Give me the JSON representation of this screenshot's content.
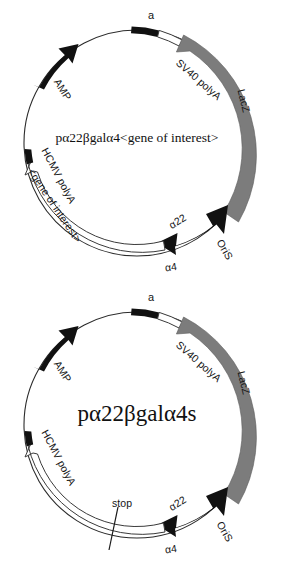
{
  "figure": {
    "kind": "plasmid-map-pair",
    "background_color": "#ffffff",
    "colors": {
      "backbone": "#2b2b2b",
      "black_feature": "#111111",
      "gray_feature": "#7c7c7c",
      "white_feature": "#ffffff",
      "text": "#151515"
    }
  },
  "plasmids": [
    {
      "id": "top",
      "center_label": "pα22βgalα4<gene of interest>",
      "features": [
        {
          "name": "a",
          "label": "a",
          "style": "black-bar",
          "arrow": "none",
          "position": "top"
        },
        {
          "name": "sv40-polya",
          "label": "SV40 polyA",
          "style": "white-bar",
          "arrow": "none",
          "position": "upper-right"
        },
        {
          "name": "lacz",
          "label": "LacZ",
          "style": "gray-arc",
          "arrow": "counterclockwise",
          "position": "right"
        },
        {
          "name": "alpha22",
          "label": "α22",
          "style": "black-arc",
          "arrow": "double",
          "position": "lower-right"
        },
        {
          "name": "oris",
          "label": "OriS",
          "style": "black-arc-inner-label",
          "arrow": "double",
          "position": "bottom-right"
        },
        {
          "name": "alpha4",
          "label": "α4",
          "style": "black-arc",
          "arrow": "double",
          "position": "bottom"
        },
        {
          "name": "gene-of-interest",
          "label": "<gene of interest>",
          "style": "white-arrow-band",
          "arrow": "counterclockwise",
          "position": "lower-left"
        },
        {
          "name": "hcmv-polya",
          "label": "HCMV polyA",
          "style": "black-bar",
          "arrow": "none",
          "position": "left"
        },
        {
          "name": "amp",
          "label": "AMP",
          "style": "black-arc",
          "arrow": "clockwise",
          "position": "upper-left"
        }
      ]
    },
    {
      "id": "bottom",
      "center_label": "pα22βgalα4s",
      "features": [
        {
          "name": "a",
          "label": "a",
          "style": "black-bar",
          "arrow": "none",
          "position": "top"
        },
        {
          "name": "sv40-polya",
          "label": "SV40 polyA",
          "style": "white-bar",
          "arrow": "none",
          "position": "upper-right"
        },
        {
          "name": "lacz",
          "label": "LacZ",
          "style": "gray-arc",
          "arrow": "counterclockwise",
          "position": "right"
        },
        {
          "name": "alpha22",
          "label": "α22",
          "style": "black-arc",
          "arrow": "double",
          "position": "lower-right"
        },
        {
          "name": "oris",
          "label": "OriS",
          "style": "black-arc-inner-label",
          "arrow": "double",
          "position": "bottom-right"
        },
        {
          "name": "alpha4",
          "label": "α4",
          "style": "black-arc",
          "arrow": "double",
          "position": "bottom"
        },
        {
          "name": "stop",
          "label": "stop",
          "style": "tick-mark",
          "arrow": "none",
          "position": "bottom-left"
        },
        {
          "name": "hcmv-polya",
          "label": "HCMV polyA",
          "style": "black-bar",
          "arrow": "none",
          "position": "left"
        },
        {
          "name": "amp",
          "label": "AMP",
          "style": "black-arc",
          "arrow": "clockwise",
          "position": "upper-left"
        }
      ]
    }
  ]
}
